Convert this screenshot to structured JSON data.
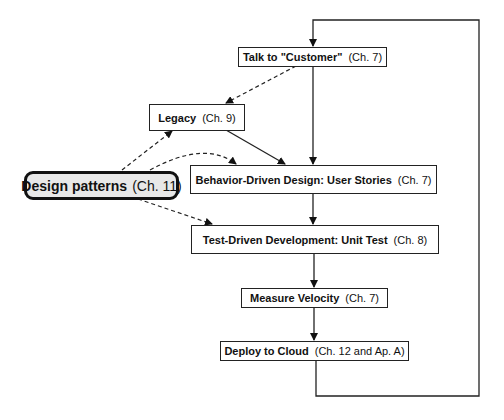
{
  "diagram": {
    "nodes": [
      {
        "id": "talk",
        "bold": "Talk to \"Customer\"",
        "ref": "(Ch. 7)"
      },
      {
        "id": "legacy",
        "bold": "Legacy",
        "ref": "(Ch. 9)"
      },
      {
        "id": "design_patterns",
        "bold": "Design patterns",
        "ref": "(Ch. 11)"
      },
      {
        "id": "bdd",
        "bold": "Behavior-Driven Design: User Stories",
        "ref": "(Ch. 7)"
      },
      {
        "id": "tdd",
        "bold": "Test-Driven Development: Unit Test",
        "ref": "(Ch. 8)"
      },
      {
        "id": "velocity",
        "bold": "Measure Velocity",
        "ref": "(Ch. 7)"
      },
      {
        "id": "deploy",
        "bold": "Deploy to Cloud",
        "ref": "(Ch. 12 and Ap. A)"
      }
    ],
    "edges": [
      {
        "from": "talk",
        "to": "bdd",
        "style": "solid"
      },
      {
        "from": "talk",
        "to": "legacy",
        "style": "dashed"
      },
      {
        "from": "legacy",
        "to": "bdd",
        "style": "solid"
      },
      {
        "from": "design_patterns",
        "to": "legacy",
        "style": "dashed"
      },
      {
        "from": "design_patterns",
        "to": "bdd",
        "style": "dashed"
      },
      {
        "from": "design_patterns",
        "to": "tdd",
        "style": "dashed"
      },
      {
        "from": "bdd",
        "to": "tdd",
        "style": "solid"
      },
      {
        "from": "tdd",
        "to": "velocity",
        "style": "solid"
      },
      {
        "from": "velocity",
        "to": "deploy",
        "style": "solid"
      },
      {
        "from": "deploy",
        "to": "talk",
        "style": "solid",
        "note": "loop back"
      }
    ]
  }
}
